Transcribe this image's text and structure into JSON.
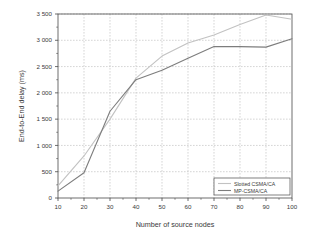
{
  "chart_data": {
    "type": "line",
    "title": "",
    "xlabel": "Number of source nodes",
    "ylabel": "End-to-End delay (ms)",
    "x": [
      10,
      20,
      30,
      40,
      50,
      60,
      70,
      80,
      90,
      100
    ],
    "xlim": [
      10,
      100
    ],
    "ylim": [
      0,
      3500
    ],
    "xticks": [
      "10",
      "20",
      "30",
      "40",
      "50",
      "60",
      "70",
      "80",
      "90",
      "100"
    ],
    "yticks": [
      "0",
      "500",
      "1 000",
      "1 500",
      "2 000",
      "2 500",
      "3 000",
      "3 500"
    ],
    "ytick_values": [
      0,
      500,
      1000,
      1500,
      2000,
      2500,
      3000,
      3500
    ],
    "grid": true,
    "grid_style": "dashed",
    "legend_position": "bottom-right",
    "series": [
      {
        "name": "Slotted CSMA/CA",
        "color": "#c2c2c2",
        "values": [
          230,
          800,
          1500,
          2280,
          2700,
          2950,
          3100,
          3300,
          3480,
          3400
        ]
      },
      {
        "name": "MP-CSMA/CA",
        "color": "#7d7d7d",
        "values": [
          130,
          480,
          1650,
          2250,
          2430,
          2660,
          2880,
          2880,
          2870,
          3030
        ]
      }
    ]
  },
  "axes": {
    "xlabel": "Number of source nodes",
    "ylabel": "End-to-End delay (ms)"
  },
  "legend": {
    "items": [
      {
        "label": "Slotted CSMA/CA"
      },
      {
        "label": "MP-CSMA/CA"
      }
    ]
  },
  "colors": {
    "series_1": "#c2c2c2",
    "series_2": "#7d7d7d",
    "axis": "#4a4a4a",
    "grid": "#b9b9b9",
    "text": "#3a3a3a",
    "background": "#ffffff"
  }
}
